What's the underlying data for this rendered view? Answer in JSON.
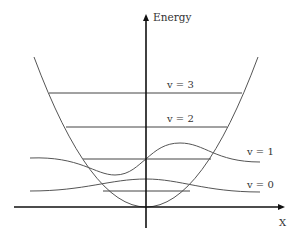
{
  "diagram": {
    "y_axis_label": "Energy",
    "x_axis_label": "X",
    "levels": [
      {
        "label": "v = 0"
      },
      {
        "label": "v = 1"
      },
      {
        "label": "v = 2"
      },
      {
        "label": "v = 3"
      }
    ]
  }
}
